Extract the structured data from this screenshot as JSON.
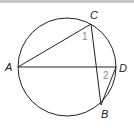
{
  "diagram": {
    "points": {
      "A": "A",
      "B": "B",
      "C": "C",
      "D": "D"
    },
    "angles": {
      "angle1": "1",
      "angle2": "2"
    },
    "colors": {
      "stroke": "#222222",
      "angle_label": "#888888",
      "top_bar": "#c8c8c8"
    }
  }
}
